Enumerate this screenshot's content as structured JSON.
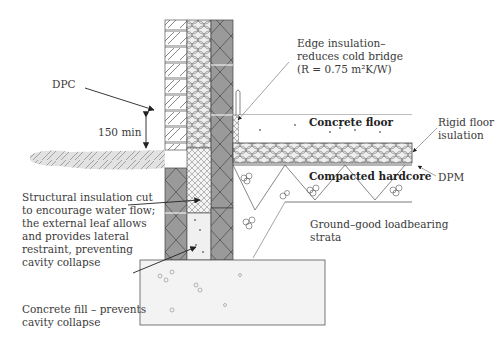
{
  "labels": {
    "dpc": "DPC",
    "min_height": "150 min",
    "edge_insulation": [
      "Edge insulation–",
      "reduces cold bridge",
      "(R = 0.75 m²K/W)"
    ],
    "concrete_floor": "Concrete floor",
    "rigid_floor_insulation": [
      "Rigid floor",
      "isulation"
    ],
    "compacted_hardcore": "Compacted hardcore",
    "dpm": "DPM",
    "ground": [
      "Ground–good loadbearing",
      "strata"
    ],
    "structural_insulation": [
      "Structural insulation cut",
      "to encourage water flow;",
      "the external leaf allows",
      "and provides lateral",
      "restraint, preventing",
      "cavity collapse"
    ],
    "concrete_fill": [
      "Concrete fill – prevents",
      "cavity collapse"
    ]
  },
  "colors": {
    "line": "#3a3a3a",
    "block_fill": "#9a9a9a",
    "ground_fill": "#e6e6e6",
    "insulation_fill": "#f2f2f2"
  }
}
